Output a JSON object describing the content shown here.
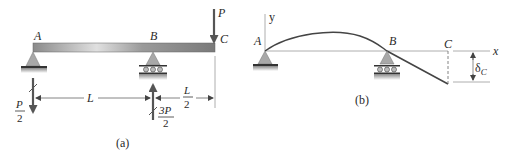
{
  "figure_a": {
    "caption": "(a)",
    "points": {
      "A": "A",
      "B": "B",
      "C": "C"
    },
    "load": {
      "label": "P"
    },
    "reaction_A": {
      "num": "P",
      "den": "2"
    },
    "reaction_B": {
      "num": "3P",
      "den": "2"
    },
    "dim_AB": "L",
    "dim_BC": {
      "num": "L",
      "den": "2"
    }
  },
  "figure_b": {
    "caption": "(b)",
    "points": {
      "A": "A",
      "B": "B",
      "C": "C"
    },
    "axis_x": "x",
    "axis_y": "y",
    "deflection": {
      "symbol": "δ",
      "subscript": "C"
    }
  },
  "colors": {
    "beam_dark": "#7a7a7a",
    "beam_light": "#d8d8d8",
    "support": "#a8a8a8",
    "arrow": "#555555",
    "line": "#999999",
    "curve": "#444444"
  }
}
